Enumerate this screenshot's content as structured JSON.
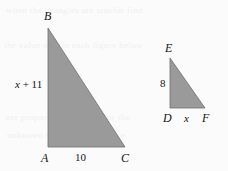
{
  "figure": {
    "background_color": "#fbfbfb",
    "fill_color": "#9a9a9a",
    "stroke_color": "#6f6f6f",
    "text_color": "#141414",
    "triangles": [
      {
        "name": "large-triangle",
        "vertices": {
          "B": {
            "label": "B",
            "x": 48,
            "y": 28
          },
          "A": {
            "label": "A",
            "x": 48,
            "y": 147
          },
          "C": {
            "label": "C",
            "x": 125,
            "y": 147
          }
        },
        "side_labels": {
          "left_leg": "x + 11",
          "left_leg_variable": "x",
          "left_leg_rest": " + 11",
          "base": "10"
        }
      },
      {
        "name": "small-triangle",
        "vertices": {
          "E": {
            "label": "E",
            "x": 170,
            "y": 58
          },
          "D": {
            "label": "D",
            "x": 170,
            "y": 108
          },
          "F": {
            "label": "F",
            "x": 205,
            "y": 108
          }
        },
        "side_labels": {
          "left_leg": "8",
          "base": "x"
        }
      }
    ],
    "ghost_text": [
      "when the triangles are similar find",
      "the value of x in each figure below",
      "use proportions to solve for the",
      "unknown side length measure"
    ]
  }
}
